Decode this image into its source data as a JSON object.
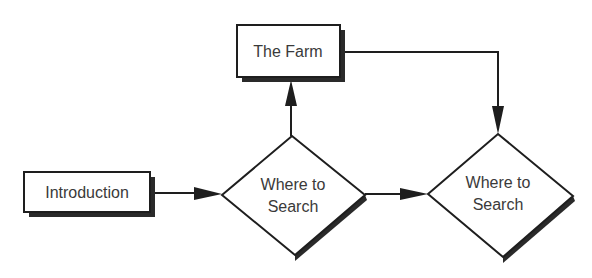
{
  "diagram": {
    "type": "flowchart",
    "colors": {
      "line": "#1e1e1e",
      "shadow": "#2a2a2a",
      "text": "#3a3a3a",
      "fill": "#ffffff"
    },
    "nodes": [
      {
        "id": "introduction",
        "shape": "rectangle",
        "label": "Introduction"
      },
      {
        "id": "the-farm",
        "shape": "rectangle",
        "label": "The Farm"
      },
      {
        "id": "where-to-search-1",
        "shape": "diamond",
        "label_line1": "Where to",
        "label_line2": "Search"
      },
      {
        "id": "where-to-search-2",
        "shape": "diamond",
        "label_line1": "Where to",
        "label_line2": "Search"
      }
    ],
    "edges": [
      {
        "from": "introduction",
        "to": "where-to-search-1"
      },
      {
        "from": "where-to-search-1",
        "to": "the-farm"
      },
      {
        "from": "where-to-search-1",
        "to": "where-to-search-2"
      },
      {
        "from": "the-farm",
        "to": "where-to-search-2"
      }
    ]
  }
}
